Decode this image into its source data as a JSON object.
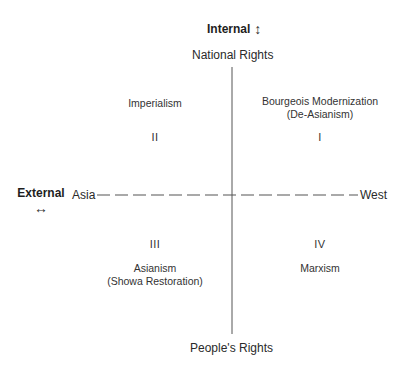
{
  "diagram": {
    "vertical_axis": {
      "title": "Internal",
      "title_icon": "up-down-arrow-icon",
      "top_pole": "National Rights",
      "bottom_pole": "People's Rights"
    },
    "horizontal_axis": {
      "title": "External",
      "title_icon": "left-right-arrow-icon",
      "left_pole": "Asia",
      "right_pole": "West",
      "line_style": "dashed"
    },
    "quadrants": [
      {
        "numeral": "I",
        "label": "Bourgeois Modernization",
        "sublabel": "(De-Asianism)"
      },
      {
        "numeral": "II",
        "label": "Imperialism",
        "sublabel": ""
      },
      {
        "numeral": "III",
        "label": "Asianism",
        "sublabel": "(Showa Restoration)"
      },
      {
        "numeral": "IV",
        "label": "Marxism",
        "sublabel": ""
      }
    ],
    "icons": {
      "up_down": "↕",
      "left_right": "↔"
    },
    "colors": {
      "line": "#555555",
      "text": "#2a2a2a"
    }
  }
}
